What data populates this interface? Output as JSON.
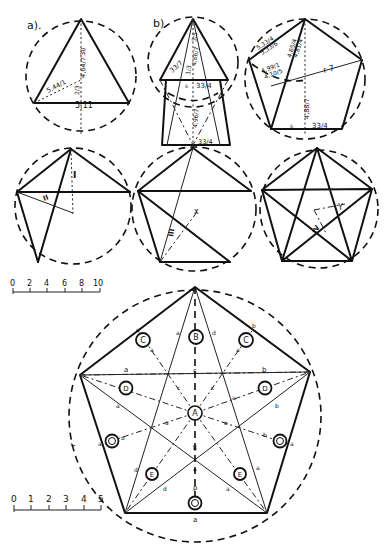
{
  "figure_labels": {
    "a": "a).",
    "b": "b)"
  },
  "fig_a": {
    "dims": {
      "base": "5,11",
      "side": "5,44/1",
      "height": "4,64/7",
      "top": "30",
      "inner": "2/3"
    }
  },
  "fig_b": {
    "dims": {
      "base": "33/4",
      "side": "33/7",
      "height_upper": "4,66/7",
      "height_lower": "4,96/7",
      "top": "3/5",
      "inner": "1/3",
      "bottom_base": "33/4",
      "s": "s"
    }
  },
  "fig_c": {
    "dims": {
      "side1": "5,33/4",
      "side2": "5,33/6",
      "diag1": "4,65/4",
      "diag2": "4,81/4",
      "inner1": "4,99/1",
      "inner2": "4,10/5",
      "r": "r 7",
      "height": "4,88/7",
      "base": "33/4",
      "s": "s"
    }
  },
  "fig_d": {
    "marks": [
      "I",
      "II"
    ]
  },
  "fig_e": {
    "marks": [
      "III",
      "x"
    ]
  },
  "fig_f": {
    "marks": [
      "IV",
      "Y"
    ]
  },
  "scale_top": {
    "ticks": [
      "0",
      "2",
      "4",
      "6",
      "8",
      "10"
    ]
  },
  "scale_bottom": {
    "ticks": [
      "0",
      "1",
      "2",
      "3",
      "4",
      "5"
    ]
  },
  "main_figure": {
    "circles": {
      "center": "A",
      "top": "B",
      "upper_sides": [
        "C",
        "C"
      ],
      "mid_sides": [
        "D",
        "D"
      ],
      "lower_sides": [
        "O",
        "O"
      ],
      "bottom_sides": [
        "E",
        "E"
      ],
      "bottom": "O"
    },
    "edge_labels": {
      "left_outer": "r",
      "top_mid": "c",
      "left_horiz": "a",
      "right_horiz": "b",
      "bottom": "a",
      "vertical_lower": "p",
      "lower_center": "e"
    },
    "small_letters": [
      "e",
      "a",
      "d",
      "b",
      "a",
      "a",
      "c",
      "c",
      "a",
      "a",
      "b",
      "a",
      "o",
      "o",
      "b",
      "a",
      "a",
      "d",
      "a",
      "d",
      "a"
    ]
  }
}
